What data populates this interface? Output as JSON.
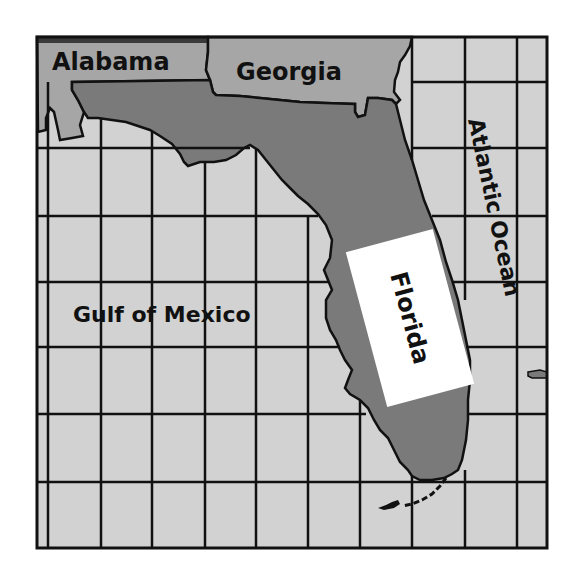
{
  "map": {
    "labels": {
      "alabama": "Alabama",
      "georgia": "Georgia",
      "florida": "Florida",
      "gulf": "Gulf of Mexico",
      "atlantic": "Atlantic Ocean"
    },
    "colors": {
      "water": "#d2d2d2",
      "neighbor_state": "#a6a6a6",
      "florida": "#7a7a7a",
      "border": "#111111",
      "label_box": "#ffffff"
    },
    "grid": {
      "vertical_lines_x": [
        48,
        101,
        152,
        205,
        256,
        308,
        360,
        412,
        465,
        517
      ],
      "horizontal_lines_y": [
        82,
        148,
        216,
        282,
        347,
        414,
        482
      ]
    }
  }
}
